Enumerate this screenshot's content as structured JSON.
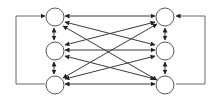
{
  "diagram": {
    "type": "bidirectional-network",
    "colors": {
      "node_stroke": "#555555",
      "edge": "#3a3a3a",
      "loop": "#666666",
      "background": "#ffffff"
    },
    "nodes": [
      {
        "id": "L1",
        "column": "left",
        "cx": 55,
        "cy": 17,
        "r": 9,
        "label": ""
      },
      {
        "id": "L2",
        "column": "left",
        "cx": 55,
        "cy": 51,
        "r": 9,
        "label": ""
      },
      {
        "id": "L3",
        "column": "left",
        "cx": 55,
        "cy": 85,
        "r": 9,
        "label": ""
      },
      {
        "id": "R1",
        "column": "right",
        "cx": 165,
        "cy": 17,
        "r": 9,
        "label": ""
      },
      {
        "id": "R2",
        "column": "right",
        "cx": 165,
        "cy": 51,
        "r": 9,
        "label": ""
      },
      {
        "id": "R3",
        "column": "right",
        "cx": 165,
        "cy": 85,
        "r": 9,
        "label": ""
      }
    ],
    "edges": [
      {
        "from": "L1",
        "to": "R1",
        "direction": "both"
      },
      {
        "from": "L1",
        "to": "R2",
        "direction": "both"
      },
      {
        "from": "L1",
        "to": "R3",
        "direction": "both"
      },
      {
        "from": "L2",
        "to": "R1",
        "direction": "both"
      },
      {
        "from": "L2",
        "to": "R2",
        "direction": "both"
      },
      {
        "from": "L2",
        "to": "R3",
        "direction": "both"
      },
      {
        "from": "L3",
        "to": "R1",
        "direction": "both"
      },
      {
        "from": "L3",
        "to": "R2",
        "direction": "both"
      },
      {
        "from": "L3",
        "to": "R3",
        "direction": "both"
      },
      {
        "from": "L1",
        "to": "L2",
        "direction": "both"
      },
      {
        "from": "L2",
        "to": "L3",
        "direction": "both"
      },
      {
        "from": "R1",
        "to": "R2",
        "direction": "both"
      },
      {
        "from": "R2",
        "to": "R3",
        "direction": "both"
      }
    ],
    "feedback_loops": [
      {
        "side": "left",
        "from": "L3",
        "to": "L1",
        "outer_x": 16
      },
      {
        "side": "right",
        "from": "R3",
        "to": "R1",
        "outer_x": 205
      }
    ]
  }
}
